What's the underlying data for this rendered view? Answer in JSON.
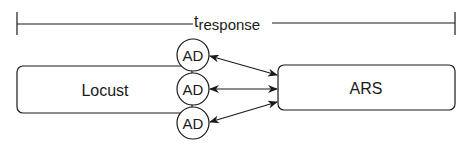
{
  "diagram": {
    "timeline": {
      "label_main": "t",
      "label_sub": "response"
    },
    "nodes": {
      "locust": {
        "label": "Locust"
      },
      "ars": {
        "label": "ARS"
      },
      "ad": [
        {
          "label": "AD"
        },
        {
          "label": "AD"
        },
        {
          "label": "AD"
        }
      ]
    },
    "colors": {
      "stroke": "#1a1a1a",
      "background": "#ffffff"
    }
  }
}
